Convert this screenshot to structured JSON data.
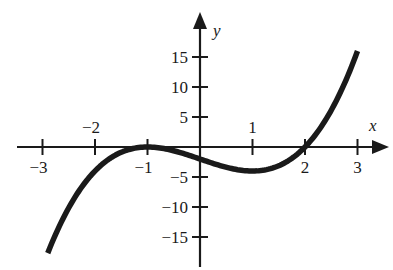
{
  "chart_data": {
    "type": "line",
    "title": "",
    "xlabel": "x",
    "ylabel": "y",
    "function": "y = (x + 1)^2 (x - 2)",
    "xlim": [
      -3.4,
      3.6
    ],
    "ylim": [
      -20,
      22
    ],
    "x_ticks": [
      {
        "value": -3,
        "label": "−3",
        "position": "below"
      },
      {
        "value": -2,
        "label": "−2",
        "position": "above"
      },
      {
        "value": -1,
        "label": "−1",
        "position": "below"
      },
      {
        "value": 1,
        "label": "1",
        "position": "above"
      },
      {
        "value": 2,
        "label": "2",
        "position": "below"
      },
      {
        "value": 3,
        "label": "3",
        "position": "below"
      }
    ],
    "y_ticks": [
      {
        "value": 15,
        "label": "15"
      },
      {
        "value": 10,
        "label": "10"
      },
      {
        "value": 5,
        "label": "5"
      },
      {
        "value": -5,
        "label": "−5"
      },
      {
        "value": -10,
        "label": "−10"
      },
      {
        "value": -15,
        "label": "−15"
      }
    ],
    "series": [
      {
        "name": "cubic curve",
        "x_range": [
          -2.9,
          3.0
        ],
        "points": [
          [
            -2.9,
            -17.7
          ],
          [
            -2.5,
            -10.1
          ],
          [
            -2.0,
            -4.0
          ],
          [
            -1.5,
            -0.9
          ],
          [
            -1.0,
            0.0
          ],
          [
            -0.5,
            -0.6
          ],
          [
            0.0,
            -2.0
          ],
          [
            0.5,
            -3.4
          ],
          [
            1.0,
            -4.0
          ],
          [
            1.5,
            -3.1
          ],
          [
            2.0,
            0.0
          ],
          [
            2.5,
            6.1
          ],
          [
            3.0,
            16.0
          ]
        ]
      }
    ],
    "features": {
      "local_max": [
        -1,
        0
      ],
      "local_min": [
        1,
        -4
      ],
      "x_intercepts": [
        -1,
        2
      ],
      "y_intercept": -2
    },
    "grid": false,
    "legend": null
  },
  "colors": {
    "ink": "#1a1a1a",
    "background": "#ffffff"
  }
}
